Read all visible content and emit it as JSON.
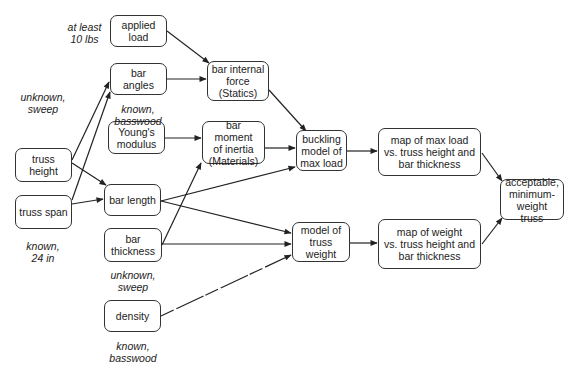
{
  "nodes": {
    "applied_load": "applied\nload",
    "bar_angles": "bar angles",
    "youngs_modulus": "Young's\nmodulus",
    "bar_length": "bar length",
    "bar_thickness": "bar\nthickness",
    "density": "density",
    "truss_height": "truss\nheight",
    "truss_span": "truss span",
    "bar_internal_force": "bar internal\nforce\n(Statics)",
    "bar_moment_of_inertia": "bar moment\nof inertia\n(Materials)",
    "buckling_model": "buckling\nmodel of\nmax load",
    "model_truss_weight": "model of\ntruss\nweight",
    "map_max_load": "map of max load\nvs. truss height and\nbar thickness",
    "map_weight": "map of weight\nvs. truss height and\nbar thickness",
    "acceptable_truss": "acceptable,\nminimum-\nweight truss"
  },
  "annotations": {
    "applied_load_note": "at least\n10 lbs",
    "truss_height_note": "unknown,\nsweep",
    "bar_angles_note": "known,\nbasswood",
    "truss_span_note": "known,\n24 in",
    "bar_thickness_note": "unknown,\nsweep",
    "density_note": "known,\nbasswood"
  },
  "edges": [
    {
      "from": "applied_load",
      "to": "bar_internal_force",
      "style": "solid"
    },
    {
      "from": "bar_angles",
      "to": "bar_internal_force",
      "style": "solid"
    },
    {
      "from": "truss_height",
      "to": "bar_angles",
      "style": "solid"
    },
    {
      "from": "truss_span",
      "to": "bar_angles",
      "style": "solid"
    },
    {
      "from": "truss_height",
      "to": "bar_length",
      "style": "solid"
    },
    {
      "from": "truss_span",
      "to": "bar_length",
      "style": "solid"
    },
    {
      "from": "youngs_modulus",
      "to": "bar_moment_of_inertia",
      "style": "solid"
    },
    {
      "from": "bar_thickness",
      "to": "bar_moment_of_inertia",
      "style": "solid"
    },
    {
      "from": "bar_internal_force",
      "to": "buckling_model",
      "style": "solid"
    },
    {
      "from": "bar_moment_of_inertia",
      "to": "buckling_model",
      "style": "solid"
    },
    {
      "from": "bar_length",
      "to": "buckling_model",
      "style": "solid"
    },
    {
      "from": "bar_length",
      "to": "model_truss_weight",
      "style": "solid"
    },
    {
      "from": "bar_thickness",
      "to": "model_truss_weight",
      "style": "solid"
    },
    {
      "from": "density",
      "to": "model_truss_weight",
      "style": "dashed"
    },
    {
      "from": "buckling_model",
      "to": "map_max_load",
      "style": "solid"
    },
    {
      "from": "model_truss_weight",
      "to": "map_weight",
      "style": "solid"
    },
    {
      "from": "map_max_load",
      "to": "acceptable_truss",
      "style": "solid"
    },
    {
      "from": "map_weight",
      "to": "acceptable_truss",
      "style": "solid"
    }
  ]
}
